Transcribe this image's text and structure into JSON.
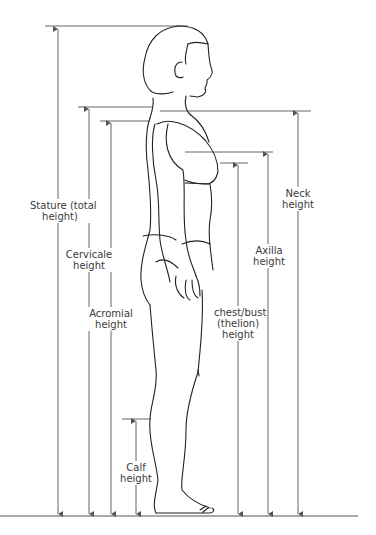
{
  "diagram": {
    "line_color": "#555555",
    "figure_color": "#222222",
    "measurements": [
      {
        "id": "stature",
        "label_line1": "Stature (total",
        "label_line2": "height)"
      },
      {
        "id": "cervicale",
        "label_line1": "Cervicale",
        "label_line2": "height"
      },
      {
        "id": "acromial",
        "label_line1": "Acromial",
        "label_line2": "height"
      },
      {
        "id": "neck",
        "label_line1": "Neck",
        "label_line2": "height"
      },
      {
        "id": "axilla",
        "label_line1": "Axilla",
        "label_line2": "height"
      },
      {
        "id": "chest",
        "label_line1": "chest/bust",
        "label_line2": "(thelion)",
        "label_line3": "height"
      },
      {
        "id": "calf",
        "label_line1": "Calf",
        "label_line2": "height"
      }
    ]
  }
}
